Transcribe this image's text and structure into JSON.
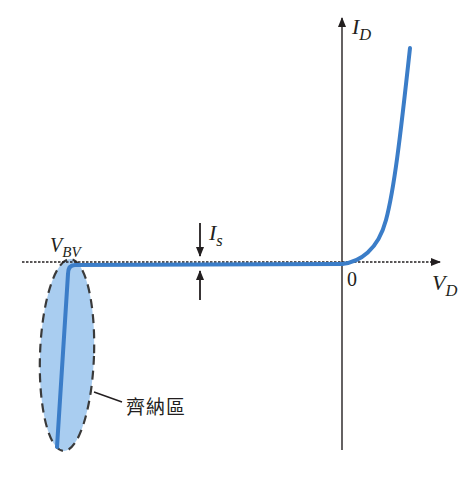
{
  "colors": {
    "curve": "#3b7dc8",
    "zener_fill": "#a9cdf0",
    "axis": "#231f20"
  },
  "axes": {
    "y_label_main": "I",
    "y_label_sub": "D",
    "x_label_main": "V",
    "x_label_sub": "D",
    "origin_label": "0"
  },
  "annotations": {
    "breakdown_main": "V",
    "breakdown_sub": "BV",
    "saturation_main": "I",
    "saturation_sub": "s",
    "zener_region": "齊納區"
  }
}
